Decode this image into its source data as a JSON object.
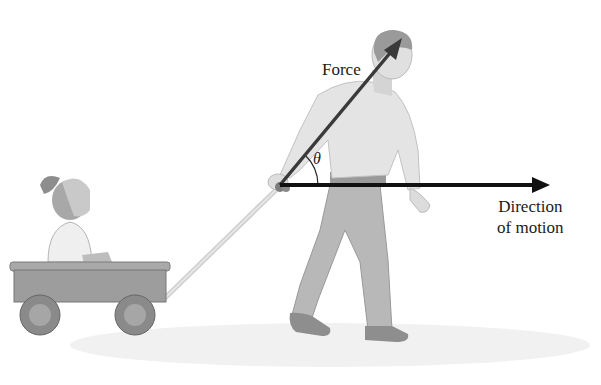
{
  "figure": {
    "labels": {
      "force": "Force",
      "angle": "θ",
      "direction_line1": "Direction",
      "direction_line2": "of motion"
    },
    "vectors": {
      "force": {
        "from": [
          280,
          185
        ],
        "to": [
          400,
          40
        ],
        "color": "#3a3a3a"
      },
      "motion": {
        "from": [
          280,
          185
        ],
        "to": [
          550,
          185
        ],
        "color": "#111111"
      }
    },
    "colors": {
      "background": "#ffffff",
      "figure_gray": "#9a9a9a",
      "light_gray": "#d8d8d8",
      "dark_gray": "#6e6e6e",
      "text": "#1a1a1a"
    }
  }
}
